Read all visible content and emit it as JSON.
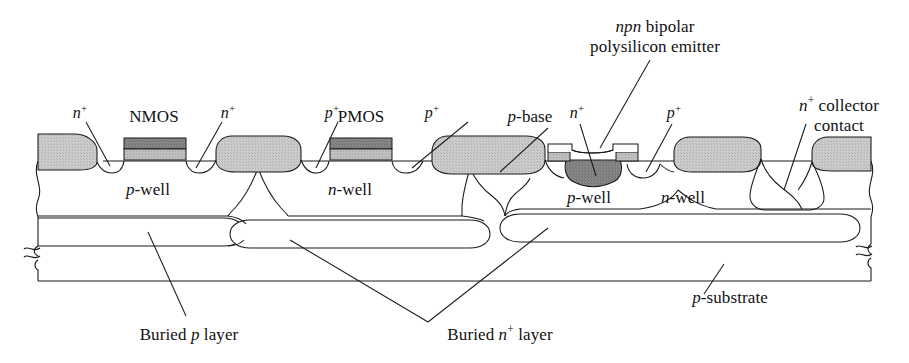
{
  "figure": {
    "kind": "semiconductor-cross-section"
  },
  "colors": {
    "outline": "#1a1a1a",
    "background": "#ffffff",
    "isolation_fill": "#c9c9c9",
    "gate_poly_dark": "#7d7d7d",
    "gate_oxide_light": "#bdbdbd",
    "emitter_dark": "#8a8a8a",
    "text": "#111111"
  },
  "labels": {
    "nplus_nmos_source": {
      "base": "n",
      "sup": "+"
    },
    "nmos": {
      "text": "NMOS"
    },
    "nplus_nmos_drain": {
      "base": "n",
      "sup": "+"
    },
    "pplus_pmos_source": {
      "base": "p",
      "sup": "+"
    },
    "pmos": {
      "text": "PMOS"
    },
    "pplus_pmos_drain": {
      "base": "p",
      "sup": "+"
    },
    "p_base": {
      "italic": "p",
      "rest": "-base"
    },
    "nplus_emitter": {
      "base": "n",
      "sup": "+"
    },
    "pplus_base_contact": {
      "base": "p",
      "sup": "+"
    },
    "npn_bipolar": {
      "italic": "npn",
      "rest": " bipolar",
      "line2": "polysilicon emitter"
    },
    "nplus_collector": {
      "base": "n",
      "sup": "+",
      "rest": " collector",
      "line2": "contact"
    },
    "p_well_left": {
      "italic": "p",
      "rest": "-well"
    },
    "n_well_left": {
      "italic": "n",
      "rest": "-well"
    },
    "p_well_right": {
      "italic": "p",
      "rest": "-well"
    },
    "n_well_right": {
      "italic": "n",
      "rest": "-well"
    },
    "p_substrate": {
      "italic": "p",
      "rest": "-substrate"
    },
    "buried_p_layer": {
      "pre": "Buried ",
      "italic": "p",
      "rest": " layer"
    },
    "buried_nplus_layer": {
      "pre": "Buried ",
      "italic": "n",
      "sup": "+",
      "rest": " layer"
    }
  }
}
